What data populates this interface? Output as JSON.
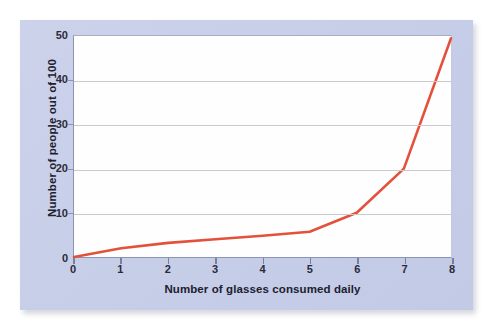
{
  "colors": {
    "panel_background": "#c7cee8",
    "plot_background": "#fefefe",
    "series_line": "#e4513a",
    "gridline": "#c9c9cf",
    "axis": "#8d93b4",
    "text": "#20202e"
  },
  "chart_data": {
    "type": "line",
    "title": "",
    "subtitle": "",
    "xlabel": "Number of glasses consumed daily",
    "ylabel": "Number of people out of 100",
    "xlim": [
      0,
      8
    ],
    "ylim": [
      0,
      50
    ],
    "xticks": [
      "0",
      "1",
      "2",
      "3",
      "4",
      "5",
      "6",
      "7",
      "8"
    ],
    "yticks": [
      "0",
      "10",
      "20",
      "30",
      "40",
      "50"
    ],
    "grid": "horizontal",
    "legend": "none",
    "x": [
      0,
      1,
      2,
      3,
      4,
      5,
      6,
      7,
      8
    ],
    "values": [
      0,
      2,
      3.2,
      4,
      4.8,
      5.7,
      10,
      20,
      49.5
    ],
    "series": [
      {
        "name": "People out of 100",
        "color": "#e4513a",
        "values": [
          0,
          2,
          3.2,
          4,
          4.8,
          5.7,
          10,
          20,
          49.5
        ]
      }
    ],
    "annotations": []
  }
}
